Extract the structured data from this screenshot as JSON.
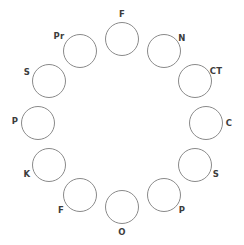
{
  "figure": {
    "type": "ring-diagram",
    "background_color": "#ffffff",
    "stroke_color": "#8a8a8a",
    "label_color": "#3c3c3c",
    "stroke_width_px": 1,
    "node_count": 12,
    "node_diameter_px": 34,
    "ring_center": {
      "x": 122,
      "y": 123
    },
    "ring_radius_px": 84,
    "label_font_size_px": 8.5
  },
  "nodes": [
    {
      "id": "node-1",
      "label": "F",
      "angle_deg": 270,
      "cx": 122,
      "cy": 39,
      "label_x": 122,
      "label_y": 14,
      "label_anchor": "top"
    },
    {
      "id": "node-2",
      "label": "N",
      "angle_deg": 300,
      "cx": 164,
      "cy": 51,
      "label_x": 182,
      "label_y": 38,
      "label_anchor": "top-right"
    },
    {
      "id": "node-3",
      "label": "CT",
      "angle_deg": 330,
      "cx": 195,
      "cy": 81,
      "label_x": 216,
      "label_y": 71,
      "label_anchor": "right"
    },
    {
      "id": "node-4",
      "label": "C",
      "angle_deg": 0,
      "cx": 206,
      "cy": 123,
      "label_x": 229,
      "label_y": 123,
      "label_anchor": "right"
    },
    {
      "id": "node-5",
      "label": "S",
      "angle_deg": 30,
      "cx": 195,
      "cy": 165,
      "label_x": 216,
      "label_y": 174,
      "label_anchor": "right"
    },
    {
      "id": "node-6",
      "label": "P",
      "angle_deg": 60,
      "cx": 164,
      "cy": 195,
      "label_x": 182,
      "label_y": 210,
      "label_anchor": "bottom-right"
    },
    {
      "id": "node-7",
      "label": "O",
      "angle_deg": 90,
      "cx": 122,
      "cy": 207,
      "label_x": 122,
      "label_y": 232,
      "label_anchor": "bottom"
    },
    {
      "id": "node-8",
      "label": "F",
      "angle_deg": 120,
      "cx": 80,
      "cy": 195,
      "label_x": 61,
      "label_y": 210,
      "label_anchor": "bottom-left"
    },
    {
      "id": "node-9",
      "label": "K",
      "angle_deg": 150,
      "cx": 49,
      "cy": 165,
      "label_x": 27,
      "label_y": 174,
      "label_anchor": "left"
    },
    {
      "id": "node-10",
      "label": "P",
      "angle_deg": 180,
      "cx": 38,
      "cy": 123,
      "label_x": 15,
      "label_y": 121,
      "label_anchor": "left"
    },
    {
      "id": "node-11",
      "label": "S",
      "angle_deg": 210,
      "cx": 49,
      "cy": 81,
      "label_x": 27,
      "label_y": 72,
      "label_anchor": "left"
    },
    {
      "id": "node-12",
      "label": "Pr",
      "angle_deg": 240,
      "cx": 80,
      "cy": 51,
      "label_x": 59,
      "label_y": 36,
      "label_anchor": "top-left"
    }
  ]
}
